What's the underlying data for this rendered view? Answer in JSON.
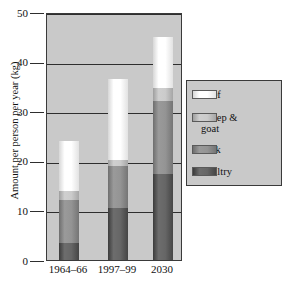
{
  "chart_data": {
    "type": "bar",
    "subtype": "stacked-column",
    "title": "",
    "xlabel": "",
    "ylabel": "Amount per person per year (kg)",
    "categories": [
      "1964–66",
      "1997–99",
      "2030"
    ],
    "ylim": [
      0,
      50
    ],
    "yticks": [
      0,
      10,
      20,
      30,
      40,
      50
    ],
    "ytick_labels": [
      "0",
      "10",
      "20",
      "30",
      "40",
      "50"
    ],
    "grid": true,
    "legend_position": "right",
    "series": [
      {
        "name": "Poultry",
        "color": "#5c5c5c",
        "values": [
          3.4,
          10.4,
          17.3
        ]
      },
      {
        "name": "Pork",
        "color": "#8f8f8f",
        "values": [
          8.6,
          8.6,
          14.7
        ]
      },
      {
        "name": "Sheep & goat",
        "color": "#c6c6c6",
        "values": [
          2.0,
          1.2,
          2.6
        ]
      },
      {
        "name": "Beef",
        "color": "#fbfbfb",
        "values": [
          10.0,
          16.3,
          10.4
        ]
      }
    ],
    "stack_order_bottom_to_top": [
      "Poultry",
      "Pork",
      "Sheep & goat",
      "Beef"
    ],
    "totals": [
      24.0,
      36.5,
      45.0
    ],
    "plot_background": "#c9c9c9",
    "axis_color": "#2e2e2e"
  },
  "legend": {
    "items": [
      {
        "label": "Beef",
        "key": "beef"
      },
      {
        "label": "Sheep &\ngoat",
        "key": "sheep"
      },
      {
        "label": "Pork",
        "key": "pork"
      },
      {
        "label": "Poultry",
        "key": "poultry"
      }
    ]
  }
}
